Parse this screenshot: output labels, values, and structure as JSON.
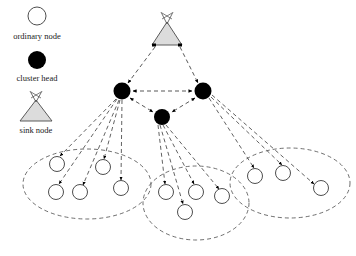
{
  "figure": {
    "background_color": "#ffffff",
    "line_color": "#3a3a3a",
    "node_fill_ordinary": "#ffffff",
    "node_fill_cluster_head": "#000000",
    "sink_fill": "#d9d9d9"
  },
  "legend": {
    "items": [
      {
        "key": "ordinary",
        "label": "ordinary node",
        "symbol": "open-circle"
      },
      {
        "key": "cluster_head",
        "label": "cluster head",
        "symbol": "filled-circle"
      },
      {
        "key": "sink",
        "label": "sink node",
        "symbol": "antenna-triangle"
      }
    ]
  },
  "nodes": {
    "sink": {
      "id": "sink",
      "label": "sink node",
      "cx": 167,
      "cy": 34
    },
    "cluster_heads": [
      {
        "id": "ch-left",
        "label": "cluster head left",
        "cx": 122,
        "cy": 91,
        "r": 8.5
      },
      {
        "id": "ch-right",
        "label": "cluster head right",
        "cx": 203,
        "cy": 91,
        "r": 8.5
      },
      {
        "id": "ch-middle",
        "label": "cluster head middle",
        "cx": 162,
        "cy": 117,
        "r": 8
      }
    ],
    "ordinary": [
      {
        "id": "n1",
        "cluster": "left",
        "cx": 57,
        "cy": 164,
        "r": 7.5
      },
      {
        "id": "n2",
        "cluster": "left",
        "cx": 103,
        "cy": 167,
        "r": 7.5
      },
      {
        "id": "n3",
        "cluster": "left",
        "cx": 56,
        "cy": 192,
        "r": 7.5
      },
      {
        "id": "n4",
        "cluster": "left",
        "cx": 80,
        "cy": 192,
        "r": 7.5
      },
      {
        "id": "n5",
        "cluster": "left",
        "cx": 121,
        "cy": 188,
        "r": 7.5
      },
      {
        "id": "n6",
        "cluster": "middle",
        "cx": 166,
        "cy": 192,
        "r": 7.5
      },
      {
        "id": "n7",
        "cluster": "middle",
        "cx": 196,
        "cy": 192,
        "r": 7.5
      },
      {
        "id": "n8",
        "cluster": "middle",
        "cx": 222,
        "cy": 196,
        "r": 7.5
      },
      {
        "id": "n9",
        "cluster": "middle",
        "cx": 185,
        "cy": 212,
        "r": 7.5
      },
      {
        "id": "n10",
        "cluster": "right",
        "cx": 255,
        "cy": 176,
        "r": 7.5
      },
      {
        "id": "n11",
        "cluster": "right",
        "cx": 283,
        "cy": 173,
        "r": 7.5
      },
      {
        "id": "n12",
        "cluster": "right",
        "cx": 321,
        "cy": 188,
        "r": 7.5
      }
    ]
  },
  "clusters": [
    {
      "id": "cluster-left",
      "label": "left cluster boundary",
      "cx": 87,
      "cy": 184,
      "rx": 64,
      "ry": 35,
      "member_count": 5
    },
    {
      "id": "cluster-middle",
      "label": "middle cluster boundary",
      "cx": 196,
      "cy": 203,
      "rx": 53,
      "ry": 37,
      "member_count": 4
    },
    {
      "id": "cluster-right",
      "label": "right cluster boundary",
      "cx": 290,
      "cy": 183,
      "rx": 60,
      "ry": 35,
      "member_count": 3
    }
  ],
  "links": {
    "sink_to_heads": [
      {
        "from": "sink",
        "to": "ch-left",
        "style": "dashed",
        "arrow": "to"
      },
      {
        "from": "sink",
        "to": "ch-right",
        "style": "dashed",
        "arrow": "to"
      }
    ],
    "head_to_head": [
      {
        "from": "ch-left",
        "to": "ch-right",
        "style": "dashed",
        "arrow": "both"
      },
      {
        "from": "ch-left",
        "to": "ch-middle",
        "style": "dashed",
        "arrow": "both"
      },
      {
        "from": "ch-right",
        "to": "ch-middle",
        "style": "dashed",
        "arrow": "both"
      }
    ],
    "head_to_members": [
      {
        "from": "ch-left",
        "to": "n1"
      },
      {
        "from": "ch-left",
        "to": "n2"
      },
      {
        "from": "ch-left",
        "to": "n3"
      },
      {
        "from": "ch-left",
        "to": "n4"
      },
      {
        "from": "ch-left",
        "to": "n5"
      },
      {
        "from": "ch-middle",
        "to": "n6"
      },
      {
        "from": "ch-middle",
        "to": "n7"
      },
      {
        "from": "ch-middle",
        "to": "n8"
      },
      {
        "from": "ch-middle",
        "to": "n9"
      },
      {
        "from": "ch-right",
        "to": "n10"
      },
      {
        "from": "ch-right",
        "to": "n11"
      },
      {
        "from": "ch-right",
        "to": "n12"
      }
    ]
  }
}
